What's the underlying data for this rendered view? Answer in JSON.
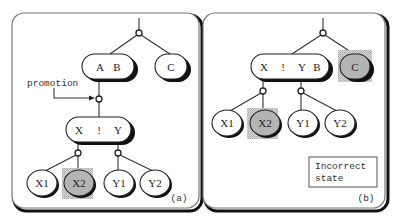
{
  "figure": {
    "panels": [
      {
        "id": "a",
        "label": "(a)",
        "annotation": "promotion",
        "nodes": {
          "ab": {
            "keys": [
              "A",
              "B"
            ]
          },
          "c": {
            "keys": [
              "C"
            ]
          },
          "xy": {
            "keys": [
              "X",
              "!",
              "Y"
            ]
          },
          "x1": {
            "label": "X1"
          },
          "x2": {
            "label": "X2",
            "highlighted": true
          },
          "y1": {
            "label": "Y1"
          },
          "y2": {
            "label": "Y2"
          }
        }
      },
      {
        "id": "b",
        "label": "(b)",
        "note": [
          "Incorrect",
          "state"
        ],
        "nodes": {
          "xyb": {
            "keys": [
              "X",
              "!",
              "Y",
              "B"
            ]
          },
          "c": {
            "keys": [
              "C"
            ],
            "highlighted": true
          },
          "x1": {
            "label": "X1"
          },
          "x2": {
            "label": "X2",
            "highlighted": true
          },
          "y1": {
            "label": "Y1"
          },
          "y2": {
            "label": "Y2"
          }
        }
      }
    ],
    "colors": {
      "highlight_fill": "#b4b4b4",
      "shadow": "#111111",
      "line": "#333333"
    }
  }
}
